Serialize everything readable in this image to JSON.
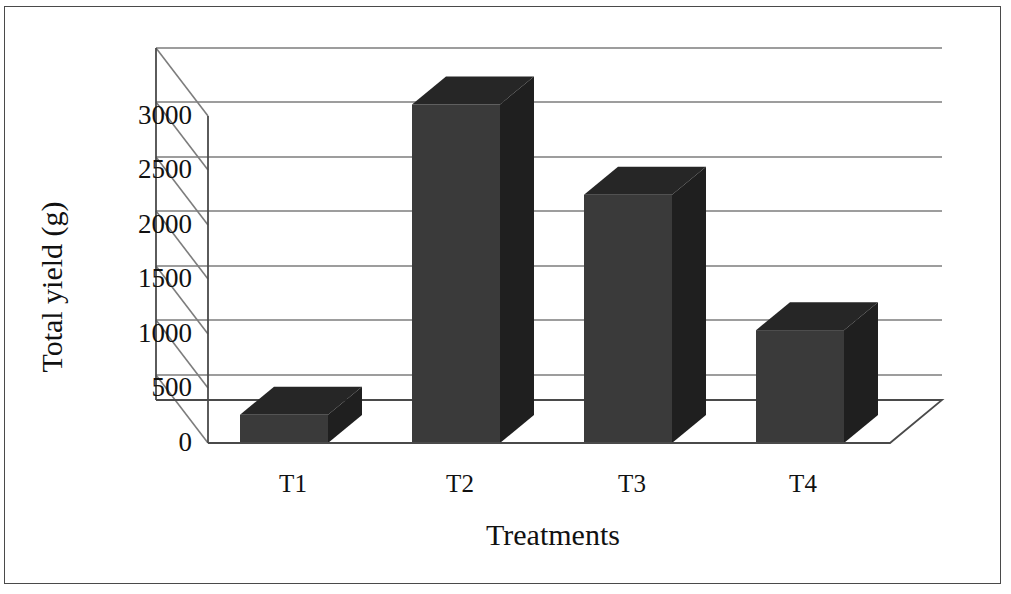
{
  "figure": {
    "border_color": "#4a4a4a",
    "background": "#ffffff"
  },
  "chart_data": {
    "type": "bar",
    "title": "",
    "subtitle": "",
    "xlabel": "Treatments",
    "ylabel": "Total yield (g)",
    "categories": [
      "T1",
      "T2",
      "T3",
      "T4"
    ],
    "values": [
      250,
      3000,
      2200,
      1000
    ],
    "series": [
      {
        "name": "Total yield (g)",
        "values": [
          250,
          3000,
          2200,
          1000
        ]
      }
    ],
    "ylim": [
      0,
      3500
    ],
    "ytick_labels": [
      "0",
      "500",
      "1000",
      "1500",
      "2000",
      "2500",
      "3000"
    ],
    "ytick_values": [
      0,
      500,
      1000,
      1500,
      2000,
      2500,
      3000
    ],
    "ymajor_step": 500,
    "grid": true,
    "grid_axis": "y",
    "legend": false,
    "legend_position": "none",
    "style": "3d-column",
    "bar_face_color": "#3a3a3a",
    "bar_side_color": "#1f1f1f",
    "bar_top_color": "#262626",
    "gridline_color": "#7d7d7d",
    "axis_color": "#4a4a4a",
    "annotations": []
  },
  "axis": {
    "y_title": "Total yield (g)",
    "x_title": "Treatments"
  }
}
